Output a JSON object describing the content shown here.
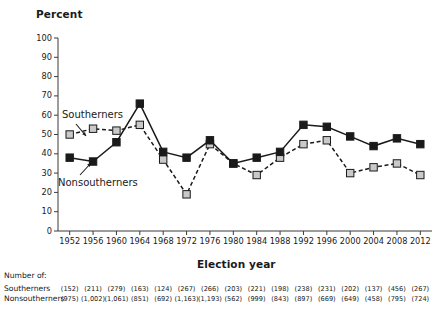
{
  "chart_data": {
    "type": "line",
    "title": "",
    "ylabel": "Percent",
    "xlabel": "Election year",
    "ylim": [
      0,
      100
    ],
    "ytick_step": 10,
    "yticks": [
      "0",
      "10",
      "20",
      "30",
      "40",
      "50",
      "60",
      "70",
      "80",
      "90",
      "100"
    ],
    "grid": false,
    "legend_position": "inline-annotation",
    "categories": [
      "1952",
      "1956",
      "1960",
      "1964",
      "1968",
      "1972",
      "1976",
      "1980",
      "1984",
      "1988",
      "1992",
      "1996",
      "2000",
      "2004",
      "2008",
      "2012"
    ],
    "series": [
      {
        "name": "Southerners",
        "marker": "square",
        "marker_fill": "#c9c9c9",
        "line_style": "dashed",
        "line_color": "#1a1a1a",
        "values": [
          50,
          53,
          52,
          55,
          37,
          19,
          45,
          35,
          29,
          38,
          45,
          47,
          30,
          33,
          35,
          29
        ]
      },
      {
        "name": "Nonsoutherners",
        "marker": "square",
        "marker_fill": "#1a1a1a",
        "line_style": "solid",
        "line_color": "#1a1a1a",
        "values": [
          38,
          36,
          46,
          66,
          41,
          38,
          47,
          35,
          38,
          41,
          55,
          54,
          49,
          44,
          48,
          45
        ]
      }
    ],
    "annotations": [
      {
        "text": "Southerners",
        "points_to": "1956 southerners point"
      },
      {
        "text": "Nonsoutherners",
        "points_to": "1956 nonsoutherners point"
      }
    ]
  },
  "ylabel": "Percent",
  "xlabel": "Election year",
  "yticks": [
    "100",
    "90",
    "80",
    "70",
    "60",
    "50",
    "40",
    "30",
    "20",
    "10",
    "0"
  ],
  "xticks": [
    "1952",
    "1956",
    "1960",
    "1964",
    "1968",
    "1972",
    "1976",
    "1980",
    "1984",
    "1988",
    "1992",
    "1996",
    "2000",
    "2004",
    "2008",
    "2012"
  ],
  "labels": {
    "southerners": "Southerners",
    "nonsoutherners": "Nonsoutherners"
  },
  "table": {
    "header": "Number of:",
    "rows": [
      {
        "label": "Southerners",
        "values": [
          "(152)",
          "(211)",
          "(279)",
          "(163)",
          "(124)",
          "(267)",
          "(266)",
          "(203)",
          "(221)",
          "(198)",
          "(238)",
          "(231)",
          "(202)",
          "(137)",
          "(456)",
          "(267)"
        ]
      },
      {
        "label": "Nonsoutherners",
        "values": [
          "(975)",
          "(1,002)",
          "(1,061)",
          "(851)",
          "(692)",
          "(1,163)",
          "(1,193)",
          "(562)",
          "(999)",
          "(843)",
          "(897)",
          "(669)",
          "(649)",
          "(458)",
          "(795)",
          "(724)"
        ]
      }
    ]
  },
  "colors": {
    "ink": "#1a1a1a",
    "marker_light": "#c9c9c9",
    "axis": "#3a3a3a"
  }
}
